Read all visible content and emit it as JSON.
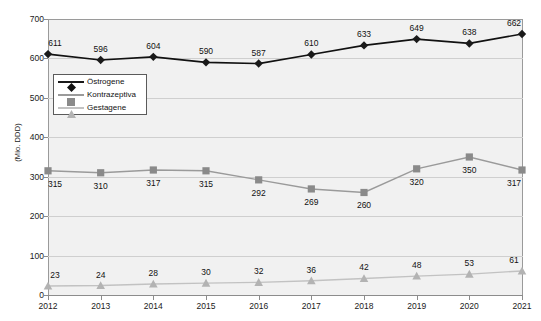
{
  "chart_data": {
    "type": "line",
    "title": "",
    "subtitle": "",
    "xlabel": "",
    "ylabel": "(Mio. DDD)",
    "categories": [
      "2012",
      "2013",
      "2014",
      "2015",
      "2016",
      "2017",
      "2018",
      "2019",
      "2020",
      "2021"
    ],
    "ylim": [
      0,
      700
    ],
    "yticks": [
      0,
      100,
      200,
      300,
      400,
      500,
      600,
      700
    ],
    "grid": true,
    "legend_position": "upper-left-inside",
    "series": [
      {
        "name": "Östrogene",
        "marker": "diamond",
        "color": "#1a1a1a",
        "values": [
          611,
          596,
          604,
          590,
          587,
          610,
          633,
          649,
          638,
          662
        ]
      },
      {
        "name": "Kontrazeptiva",
        "marker": "square",
        "color": "#8a8a8a",
        "values": [
          315,
          310,
          317,
          315,
          292,
          269,
          260,
          320,
          350,
          317
        ]
      },
      {
        "name": "Gestagene",
        "marker": "triangle",
        "color": "#b3b3b3",
        "values": [
          23,
          24,
          28,
          30,
          32,
          36,
          42,
          48,
          53,
          61
        ]
      }
    ],
    "data_labels": {
      "Östrogene": [
        "611",
        "596",
        "604",
        "590",
        "587",
        "610",
        "633",
        "649",
        "638",
        "662"
      ],
      "Kontrazeptiva": [
        "315",
        "310",
        "317",
        "315",
        "292",
        "269",
        "260",
        "320",
        "350",
        "317"
      ],
      "Gestagene": [
        "23",
        "24",
        "28",
        "30",
        "32",
        "36",
        "42",
        "48",
        "53",
        "61"
      ]
    },
    "ytick_labels": [
      "0",
      "100",
      "200",
      "300",
      "400",
      "500",
      "600",
      "700"
    ],
    "colors": {
      "plot_background": "#f1f1f1",
      "gridline": "#cfcfcf",
      "axis": "#9a9a9a",
      "page_background": "#ffffff"
    }
  },
  "legend": {
    "items": [
      {
        "label": "Östrogene"
      },
      {
        "label": "Kontrazeptiva"
      },
      {
        "label": "Gestagene"
      }
    ]
  }
}
